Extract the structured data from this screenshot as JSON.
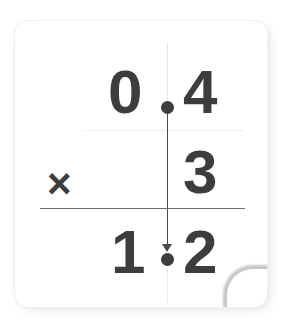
{
  "card": {
    "background_color": "#ffffff",
    "ink_color": "#3d3d3d",
    "rule_color": "#6c6c6c",
    "guide_color": "#cfcfcf"
  },
  "problem": {
    "type": "decimal-multiplication",
    "expression": "0.4 x 3 = 1.2",
    "operator": "×",
    "multiplicand": {
      "value": "0.4",
      "integer_part": "0",
      "decimal_separator": ".",
      "fraction_part": "4"
    },
    "multiplier": {
      "value": "3"
    },
    "product": {
      "value": "1.2",
      "integer_part": "1",
      "decimal_separator": ".",
      "fraction_part": "2"
    },
    "decimal_places": 1,
    "guides": {
      "decimal_alignment_line": "vertical-dotted-to-solid-with-arrow",
      "row_separator_line": "horizontal-dotted",
      "answer_line": "horizontal-solid"
    }
  }
}
